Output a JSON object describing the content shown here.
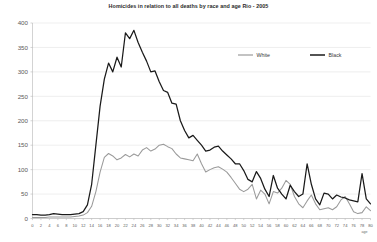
{
  "chart_data": {
    "type": "line",
    "title": "Homicides in relation to all deaths by race and age Rio - 2005",
    "xlabel": "age",
    "ylabel": "",
    "xlim": [
      0,
      80
    ],
    "ylim": [
      0,
      400
    ],
    "grid": true,
    "legend_position": "top-right-inside",
    "yticks": [
      0,
      50,
      100,
      150,
      200,
      250,
      300,
      350,
      400
    ],
    "ytick_labels": [
      "0",
      "50",
      "100",
      "150",
      "200",
      "250",
      "300",
      "350",
      "400"
    ],
    "xticks": [
      0,
      2,
      4,
      6,
      8,
      10,
      12,
      14,
      16,
      18,
      20,
      22,
      24,
      26,
      28,
      30,
      32,
      34,
      36,
      38,
      40,
      42,
      44,
      46,
      48,
      50,
      52,
      54,
      56,
      58,
      60,
      62,
      64,
      66,
      68,
      70,
      72,
      74,
      76,
      78,
      80
    ],
    "xtick_labels": [
      "0",
      "2",
      "4",
      "6",
      "8",
      "10",
      "12",
      "14",
      "16",
      "18",
      "20",
      "22",
      "24",
      "26",
      "28",
      "30",
      "32",
      "34",
      "36",
      "38",
      "40",
      "42",
      "44",
      "46",
      "48",
      "50",
      "52",
      "54",
      "56",
      "58",
      "60",
      "62",
      "64",
      "66",
      "68",
      "70",
      "72",
      "74",
      "76",
      "78",
      "80"
    ],
    "x": [
      0,
      1,
      2,
      3,
      4,
      5,
      6,
      7,
      8,
      9,
      10,
      11,
      12,
      13,
      14,
      15,
      16,
      17,
      18,
      19,
      20,
      21,
      22,
      23,
      24,
      25,
      26,
      27,
      28,
      29,
      30,
      31,
      32,
      33,
      34,
      35,
      36,
      37,
      38,
      39,
      40,
      41,
      42,
      43,
      44,
      45,
      46,
      47,
      48,
      49,
      50,
      51,
      52,
      53,
      54,
      55,
      56,
      57,
      58,
      59,
      60,
      61,
      62,
      63,
      64,
      65,
      66,
      67,
      68,
      69,
      70,
      71,
      72,
      73,
      74,
      75,
      76,
      77,
      78,
      79,
      80
    ],
    "series": [
      {
        "name": "White",
        "color": "#9a9a9a",
        "values": [
          2,
          2,
          2,
          2,
          3,
          3,
          3,
          3,
          3,
          3,
          4,
          5,
          7,
          12,
          25,
          55,
          95,
          125,
          133,
          128,
          120,
          124,
          131,
          126,
          132,
          128,
          140,
          145,
          138,
          142,
          150,
          152,
          147,
          143,
          132,
          124,
          122,
          120,
          118,
          132,
          112,
          95,
          100,
          104,
          106,
          101,
          95,
          84,
          72,
          60,
          55,
          60,
          70,
          40,
          58,
          50,
          30,
          55,
          52,
          62,
          78,
          70,
          45,
          30,
          22,
          36,
          48,
          30,
          18,
          20,
          22,
          18,
          24,
          38,
          45,
          30,
          14,
          10,
          12,
          24,
          16
        ]
      },
      {
        "name": "Black",
        "color": "#1a1a1a",
        "values": [
          8,
          8,
          7,
          7,
          8,
          10,
          9,
          8,
          8,
          8,
          9,
          10,
          14,
          28,
          70,
          150,
          230,
          285,
          318,
          300,
          330,
          310,
          380,
          368,
          385,
          360,
          340,
          322,
          300,
          302,
          280,
          262,
          258,
          236,
          234,
          200,
          180,
          165,
          170,
          160,
          150,
          138,
          140,
          146,
          148,
          138,
          130,
          122,
          112,
          112,
          98,
          80,
          75,
          96,
          82,
          60,
          45,
          88,
          62,
          50,
          40,
          68,
          55,
          45,
          50,
          112,
          70,
          40,
          28,
          52,
          50,
          40,
          48,
          44,
          42,
          38,
          36,
          34,
          92,
          40,
          30
        ]
      }
    ]
  },
  "legend": {
    "entries": [
      {
        "label": "White",
        "color": "#9a9a9a"
      },
      {
        "label": "Black",
        "color": "#1a1a1a"
      }
    ]
  }
}
